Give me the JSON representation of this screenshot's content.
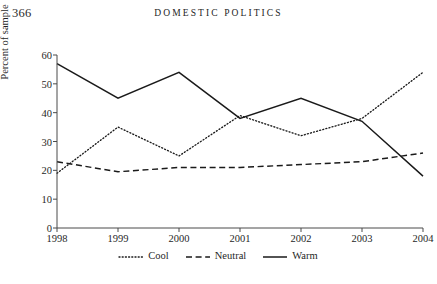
{
  "page": {
    "folio": "366",
    "running_head": "Domestic Politics"
  },
  "chart_data": {
    "type": "line",
    "title": "",
    "xlabel": "",
    "ylabel": "Percent of sample",
    "categories": [
      "1998",
      "1999",
      "2000",
      "2001",
      "2002",
      "2003",
      "2004"
    ],
    "x": [
      1998,
      1999,
      2000,
      2001,
      2002,
      2003,
      2004
    ],
    "ylim": [
      0,
      60
    ],
    "yticks": [
      0,
      10,
      20,
      30,
      40,
      50,
      60
    ],
    "ytick_labels": [
      "0",
      "10",
      "20",
      "30",
      "40",
      "50",
      "60"
    ],
    "grid": false,
    "legend_position": "bottom",
    "series": [
      {
        "name": "Cool",
        "style": "dotted",
        "color": "#1a1a1a",
        "values": [
          19,
          35,
          25,
          39,
          32,
          38,
          54
        ]
      },
      {
        "name": "Neutral",
        "style": "dashed",
        "color": "#1a1a1a",
        "values": [
          23,
          19.5,
          21,
          21,
          22,
          23,
          26
        ]
      },
      {
        "name": "Warm",
        "style": "solid",
        "color": "#1a1a1a",
        "values": [
          57,
          45,
          54,
          38,
          45,
          37,
          18
        ]
      }
    ]
  }
}
